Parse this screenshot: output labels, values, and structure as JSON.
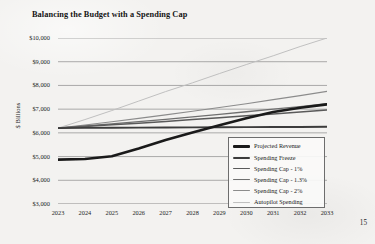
{
  "document": {
    "page_number": "15"
  },
  "chart_data": {
    "type": "line",
    "title": "Balancing the Budget with a Spending Cap",
    "xlabel": "",
    "ylabel": "$ Billions",
    "categories": [
      "2023",
      "2024",
      "2025",
      "2026",
      "2027",
      "2028",
      "2029",
      "2030",
      "2031",
      "2032",
      "2033"
    ],
    "x": [
      2023,
      2024,
      2025,
      2026,
      2027,
      2028,
      2029,
      2030,
      2031,
      2032,
      2033
    ],
    "ylim": [
      3000,
      10000
    ],
    "ytick_labels": [
      "$10,000",
      "$9,000",
      "$8,000",
      "$7,000",
      "$6,000",
      "$5,000",
      "$4,000",
      "$3,000"
    ],
    "ytick_values": [
      10000,
      9000,
      8000,
      7000,
      6000,
      5000,
      4000,
      3000
    ],
    "grid": "horizontal",
    "legend_position": "bottom-right",
    "series": [
      {
        "name": "Projected Revenue",
        "color": "#1a1a1a",
        "width": 2.6,
        "values": [
          4870,
          4900,
          5010,
          5340,
          5700,
          6020,
          6320,
          6620,
          6880,
          7060,
          7200
        ]
      },
      {
        "name": "Spending Freeze",
        "color": "#3c3c3c",
        "width": 1.9,
        "values": [
          6200,
          6210,
          6215,
          6220,
          6225,
          6230,
          6235,
          6240,
          6245,
          6250,
          6255
        ]
      },
      {
        "name": "Spending Cap - 1%",
        "color": "#5a5a5a",
        "width": 1.5,
        "values": [
          6200,
          6270,
          6340,
          6410,
          6480,
          6560,
          6640,
          6720,
          6800,
          6880,
          6960
        ]
      },
      {
        "name": "Spending Cap - 1.3%",
        "color": "#6f6f6f",
        "width": 1.3,
        "values": [
          6200,
          6290,
          6380,
          6470,
          6570,
          6670,
          6780,
          6890,
          7000,
          7110,
          7230
        ]
      },
      {
        "name": "Spending Cap - 2%",
        "color": "#8c8c8c",
        "width": 1.1,
        "values": [
          6200,
          6330,
          6470,
          6610,
          6760,
          6910,
          7070,
          7230,
          7400,
          7570,
          7750
        ]
      },
      {
        "name": "Autopilot Spending",
        "color": "#c0c0c0",
        "width": 1.0,
        "values": [
          6200,
          6560,
          6940,
          7340,
          7740,
          8110,
          8500,
          8880,
          9250,
          9640,
          10000
        ]
      }
    ]
  }
}
